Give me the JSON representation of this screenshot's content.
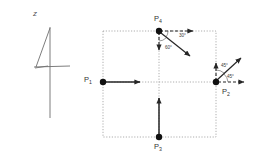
{
  "figure": {
    "background_color": "#ffffff",
    "line_color": "#333333",
    "dotted_color": "#9a9a9a",
    "sketch": {
      "glyph_name": "handwritten-four",
      "axis_label": "z"
    },
    "points": [
      {
        "id": "P1",
        "label_main": "P",
        "label_sub": "1",
        "x": 103,
        "y": 82
      },
      {
        "id": "P2",
        "label_main": "P",
        "label_sub": "2",
        "x": 216,
        "y": 82
      },
      {
        "id": "P3",
        "label_main": "P",
        "label_sub": "3",
        "x": 159,
        "y": 137
      },
      {
        "id": "P4",
        "label_main": "P",
        "label_sub": "4",
        "x": 159,
        "y": 31
      }
    ],
    "point_labels": [
      {
        "name": "point-label-p1",
        "main": "P",
        "sub": "1",
        "x": 84,
        "y": 78
      },
      {
        "name": "point-label-p2",
        "main": "P",
        "sub": "2",
        "x": 223,
        "y": 91
      },
      {
        "name": "point-label-p3",
        "main": "P",
        "sub": "3",
        "x": 155,
        "y": 144
      },
      {
        "name": "point-label-p4",
        "main": "P",
        "sub": "4",
        "x": 155,
        "y": 16
      }
    ],
    "angles": [
      {
        "name": "angle-30",
        "text": "30°",
        "x": 180,
        "y": 38
      },
      {
        "name": "angle-60",
        "text": "60°",
        "x": 166,
        "y": 50
      },
      {
        "name": "angle-45-upper",
        "text": "45°",
        "x": 222,
        "y": 67
      },
      {
        "name": "angle-45-lower",
        "text": "45°",
        "x": 228,
        "y": 78
      }
    ],
    "rect": {
      "x": 103,
      "y": 31,
      "width": 113,
      "height": 106
    },
    "vectors": [
      {
        "name": "vector-p1-right",
        "style": "solid"
      },
      {
        "name": "vector-p3-up",
        "style": "solid"
      },
      {
        "name": "vector-p4-right-dashed",
        "style": "dashed"
      },
      {
        "name": "vector-p4-down-dashed",
        "style": "dashed"
      },
      {
        "name": "vector-p4-diagonal",
        "style": "solid"
      },
      {
        "name": "vector-p2-up-dashed",
        "style": "dashed"
      },
      {
        "name": "vector-p2-right-dashed",
        "style": "dashed"
      },
      {
        "name": "vector-p2-diagonal",
        "style": "solid"
      }
    ]
  }
}
